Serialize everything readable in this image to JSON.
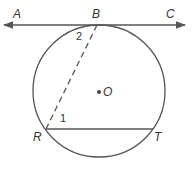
{
  "diagram": {
    "type": "geometry-circle-tangent",
    "colors": {
      "stroke": "#555555",
      "text": "#333333",
      "background": "#ffffff"
    },
    "circle": {
      "center_label": "O",
      "cx": 99,
      "cy": 91,
      "r": 66
    },
    "tangent_line": {
      "through": "B",
      "endpoints": [
        "A",
        "C"
      ],
      "arrows": "both"
    },
    "points": {
      "A": {
        "label": "A"
      },
      "B": {
        "label": "B"
      },
      "C": {
        "label": "C"
      },
      "R": {
        "label": "R"
      },
      "T": {
        "label": "T"
      },
      "O": {
        "label": "O"
      }
    },
    "segments": [
      {
        "from": "B",
        "to": "R",
        "style": "dashed"
      },
      {
        "from": "R",
        "to": "T",
        "style": "solid"
      }
    ],
    "angles": {
      "angle1": {
        "label": "1",
        "at": "R"
      },
      "angle2": {
        "label": "2",
        "at": "B"
      }
    }
  }
}
